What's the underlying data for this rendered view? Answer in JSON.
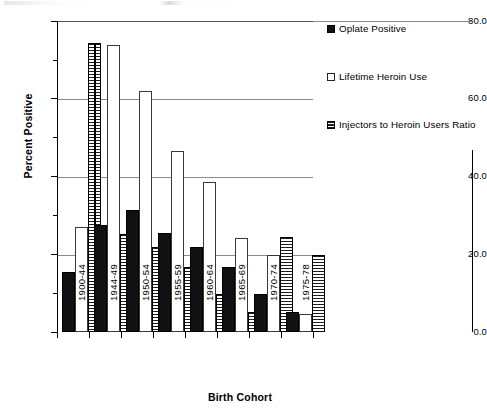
{
  "chart_data": {
    "type": "bar",
    "title": "",
    "xlabel": "Birth Cohort",
    "ylabel": "Percent Positive",
    "ylim": [
      0.0,
      80.0
    ],
    "yticks": [
      "0.0",
      "20.0",
      "40.0",
      "60.0",
      "80.0"
    ],
    "ytick_values": [
      0.0,
      20.0,
      40.0,
      60.0,
      80.0
    ],
    "grid": "horizontal",
    "legend_position": "right",
    "categories": [
      "1900-44",
      "1944-49",
      "1950-54",
      "1955-59",
      "1960-64",
      "1965-69",
      "1970-74",
      "1975-78"
    ],
    "series": [
      {
        "name": "Oplate Positive",
        "color": "#111111",
        "values": [
          15.4,
          27.4,
          31.3,
          25.4,
          21.9,
          16.7,
          9.8,
          5.1
        ]
      },
      {
        "name": "Lifetime Heroin Use",
        "color": "#ffffff",
        "values": [
          27.0,
          48.8,
          54.7,
          40.3,
          31.4,
          23.5,
          11.4,
          4.6
        ]
      },
      {
        "name": "Injectors to Heroin Users Ratio",
        "color": "#666666",
        "values": [
          74.7,
          74.7,
          74.2,
          62.2,
          46.8,
          38.6,
          24.4,
          19.8
        ]
      }
    ]
  },
  "legend": {
    "items": [
      {
        "label": "Oplate Positive",
        "swatch": "filled-black-square-icon"
      },
      {
        "label": "Lifetime Heroin Use",
        "swatch": "open-white-square-icon"
      },
      {
        "label": "Injectors to Heroin Users Ratio",
        "swatch": "hatched-gray-square-icon"
      }
    ]
  },
  "axes": {
    "y_title": "Percent Positive",
    "x_title": "Birth Cohort"
  }
}
